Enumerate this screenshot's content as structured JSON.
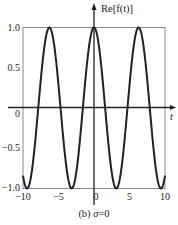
{
  "chart_data": {
    "type": "line",
    "title": "",
    "caption": "(b) σ=0",
    "caption_parts": {
      "prefix": "(b) ",
      "symbol": "σ",
      "suffix": "=0"
    },
    "xlabel": "t",
    "ylabel": "Re[f(t)]",
    "xlim": [
      -10,
      10
    ],
    "ylim": [
      -1.0,
      1.0
    ],
    "xticks": [
      -10,
      -5,
      0,
      5,
      10
    ],
    "xtick_labels": [
      "−10",
      "−5",
      "0",
      "5",
      "10"
    ],
    "yticks": [
      -1.0,
      -0.5,
      0,
      0.5,
      1.0
    ],
    "ytick_labels": [
      "−1.0",
      "−0.5",
      "0",
      "0.5",
      "1.0"
    ],
    "grid": false,
    "legend": null,
    "series": [
      {
        "name": "Re[f(t)] = cos(t)",
        "function": "cos(t)",
        "color": "#222222",
        "x": [
          -10,
          -9.42,
          -7.85,
          -6.28,
          -4.71,
          -3.14,
          -1.57,
          0,
          1.57,
          3.14,
          4.71,
          6.28,
          7.85,
          9.42,
          10
        ],
        "y": [
          -0.84,
          -1.0,
          0.0,
          1.0,
          0.0,
          -1.0,
          0.0,
          1.0,
          0.0,
          -1.0,
          0.0,
          1.0,
          0.0,
          -1.0,
          -0.84
        ]
      }
    ]
  }
}
